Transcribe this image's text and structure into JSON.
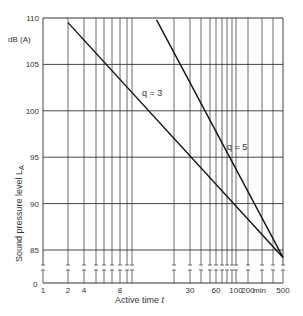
{
  "chart_data": {
    "type": "line",
    "title": "",
    "xlabel": "Active time t",
    "ylabel": "Sound pressure level L_A",
    "y_unit": "dB (A)",
    "x_unit": "min",
    "x_scale": "log",
    "xlim": [
      1,
      500
    ],
    "ylim": [
      84,
      110
    ],
    "y_axis_break": true,
    "y_break_bottom_label": "0",
    "grid": true,
    "x_ticks_labeled": [
      1,
      2,
      4,
      8,
      30,
      60,
      100,
      200,
      500
    ],
    "x_tick_labels": [
      "1",
      "2",
      "4",
      "8",
      "30",
      "60",
      "100",
      "200",
      "500"
    ],
    "x_gridlines": [
      1,
      2,
      4,
      5,
      6,
      7,
      8,
      9,
      10,
      20,
      30,
      40,
      50,
      60,
      70,
      80,
      90,
      100,
      200,
      300,
      400,
      500
    ],
    "y_ticks": [
      85,
      90,
      95,
      100,
      105,
      110
    ],
    "y_tick_labels": [
      "85",
      "90",
      "95",
      "100",
      "105",
      "110"
    ],
    "series": [
      {
        "name": "q = 3",
        "x": [
          2,
          500
        ],
        "y": [
          109.5,
          84.2
        ]
      },
      {
        "name": "q = 5",
        "x": [
          15,
          500
        ],
        "y": [
          109.8,
          84.2
        ]
      }
    ],
    "annotations": [
      {
        "text": "q = 3",
        "near_series": "q = 3"
      },
      {
        "text": "q = 5",
        "near_series": "q = 5"
      }
    ]
  },
  "labels": {
    "y_unit": "dB (A)",
    "ylabel": "Sound pressure level L",
    "ylabel_sub": "A",
    "xlabel": "Active time ",
    "xlabel_var": "t",
    "x_unit": "min",
    "q3": "q = 3",
    "q5": "q = 5",
    "y_break_zero": "0"
  },
  "px": {
    "x": {
      "1": 43,
      "2": 68,
      "4": 84,
      "5": 96,
      "6": 104,
      "7": 112,
      "8": 120,
      "9": 127,
      "10": 132,
      "20": 174,
      "30": 190,
      "40": 201,
      "50": 210,
      "60": 216,
      "70": 222,
      "80": 227,
      "90": 232,
      "100": 236,
      "200": 248,
      "300": 262,
      "400": 273,
      "500": 283
    },
    "y": {
      "110": 18,
      "105": 64,
      "100": 111,
      "95": 157,
      "90": 204,
      "85": 250,
      "84.2": 258,
      "zero": 283
    }
  }
}
